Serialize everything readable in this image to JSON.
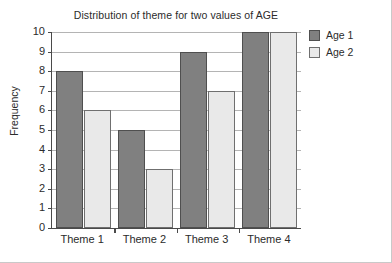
{
  "chart_data": {
    "type": "bar",
    "title": "Distribution of theme for two values of AGE",
    "xlabel": "",
    "ylabel": "Frequency",
    "categories": [
      "Theme 1",
      "Theme 2",
      "Theme 3",
      "Theme 4"
    ],
    "series": [
      {
        "name": "Age 1",
        "values": [
          8,
          5,
          9,
          10
        ],
        "color": "#808080"
      },
      {
        "name": "Age 2",
        "values": [
          6,
          3,
          7,
          10
        ],
        "color": "#e9e9e9"
      }
    ],
    "ylim": [
      0,
      10
    ],
    "ytick_labels": [
      "10",
      "9",
      "8",
      "7",
      "6",
      "5",
      "4",
      "3",
      "2",
      "1",
      "0"
    ],
    "ytick_values": [
      10,
      9,
      8,
      7,
      6,
      5,
      4,
      3,
      2,
      1,
      0
    ],
    "grid": "horizontal",
    "legend_position": "right-top"
  }
}
